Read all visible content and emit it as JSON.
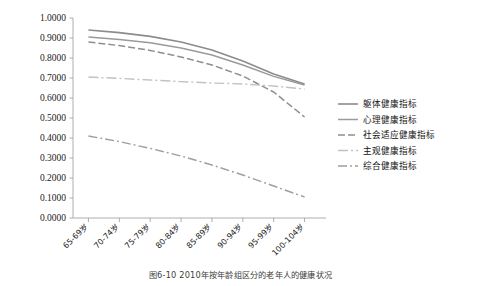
{
  "caption": "图6-10  2010年按年龄组区分的老年人的健康状况",
  "chart_data": {
    "type": "line",
    "title": "",
    "xlabel": "",
    "ylabel": "",
    "categories": [
      "65-69岁",
      "70-74岁",
      "75-79岁",
      "80-84岁",
      "85-89岁",
      "90-94岁",
      "95-99岁",
      "100-104岁"
    ],
    "ylim": [
      0.0,
      1.0
    ],
    "ytick_labels": [
      "0.0000",
      "0.1000",
      "0.2000",
      "0.3000",
      "0.4000",
      "0.5000",
      "0.6000",
      "0.7000",
      "0.8000",
      "0.9000",
      "1.0000"
    ],
    "ytick_values": [
      0.0,
      0.1,
      0.2,
      0.3,
      0.4,
      0.5,
      0.6,
      0.7,
      0.8,
      0.9,
      1.0
    ],
    "grid": false,
    "legend_position": "right",
    "series": [
      {
        "name": "躯体健康指标",
        "color": "#8c8c8c",
        "dash": "none",
        "width": 1.6,
        "values": [
          0.94,
          0.927,
          0.908,
          0.88,
          0.84,
          0.785,
          0.72,
          0.67
        ]
      },
      {
        "name": "心理健康指标",
        "color": "#9a9a9a",
        "dash": "none",
        "width": 1.5,
        "values": [
          0.905,
          0.893,
          0.876,
          0.85,
          0.815,
          0.765,
          0.708,
          0.665
        ]
      },
      {
        "name": "社会适应健康指标",
        "color": "#8f8f8f",
        "dash": "7,3",
        "width": 1.5,
        "values": [
          0.88,
          0.862,
          0.838,
          0.805,
          0.765,
          0.71,
          0.63,
          0.505
        ]
      },
      {
        "name": "主观健康指标",
        "color": "#c2c2c2",
        "dash": "10,3,2,3",
        "width": 1.4,
        "values": [
          0.705,
          0.698,
          0.69,
          0.682,
          0.675,
          0.67,
          0.66,
          0.645
        ]
      },
      {
        "name": "综合健康指标",
        "color": "#9e9e9e",
        "dash": "9,3,2,3",
        "width": 1.4,
        "values": [
          0.41,
          0.382,
          0.348,
          0.31,
          0.265,
          0.215,
          0.16,
          0.105
        ]
      }
    ]
  },
  "plot": {
    "left": 73,
    "right": 320,
    "top": 18,
    "bottom": 218
  },
  "legend": {
    "x": 338,
    "y": 104,
    "row_height": 15.5,
    "swatch_width": 20,
    "text_offset": 25
  }
}
